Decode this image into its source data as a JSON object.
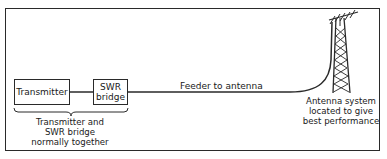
{
  "diagram": {
    "type": "block-diagram",
    "nodes": {
      "transmitter": {
        "label": "Transmitter"
      },
      "swr_bridge": {
        "label_line1": "SWR",
        "label_line2": "bridge"
      },
      "antenna": {
        "icon": "antenna-tower-icon"
      }
    },
    "edges": {
      "tx_to_swr": {
        "label": ""
      },
      "feeder": {
        "label": "Feeder to antenna"
      }
    },
    "annotations": {
      "group_caption_line1": "Transmitter and",
      "group_caption_line2": "SWR bridge",
      "group_caption_line3": "normally together",
      "antenna_caption_line1": "Antenna system",
      "antenna_caption_line2": "located to give",
      "antenna_caption_line3": "best performance"
    },
    "colors": {
      "stroke": "#2a2a2a",
      "background": "#ffffff",
      "text": "#1a1a1a"
    }
  }
}
